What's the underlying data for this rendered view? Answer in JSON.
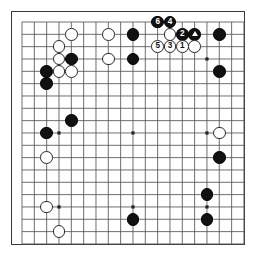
{
  "app": {
    "title": "Go Board Diagram",
    "type": "go-game-diagram"
  },
  "board": {
    "size": 19,
    "origin_x": 22,
    "origin_y": 22,
    "spacing": 12.33,
    "stone_radius": 6.3,
    "line_color": "#555555",
    "border_color": "#3a3a3a",
    "background": "#ffffff",
    "black_color": "#111111",
    "white_color": "#ffffff",
    "star_points": [
      {
        "col": 3,
        "row": 3
      },
      {
        "col": 9,
        "row": 3
      },
      {
        "col": 15,
        "row": 3
      },
      {
        "col": 3,
        "row": 9
      },
      {
        "col": 9,
        "row": 9
      },
      {
        "col": 15,
        "row": 9
      },
      {
        "col": 3,
        "row": 15
      },
      {
        "col": 9,
        "row": 15
      },
      {
        "col": 15,
        "row": 15
      }
    ]
  },
  "stones": [
    {
      "col": 4,
      "row": 1,
      "color": "white",
      "label": ""
    },
    {
      "col": 3,
      "row": 2,
      "color": "white",
      "label": ""
    },
    {
      "col": 3,
      "row": 3,
      "color": "white",
      "label": ""
    },
    {
      "col": 4,
      "row": 3,
      "color": "black",
      "label": ""
    },
    {
      "col": 2,
      "row": 4,
      "color": "black",
      "label": ""
    },
    {
      "col": 3,
      "row": 4,
      "color": "white",
      "label": ""
    },
    {
      "col": 4,
      "row": 4,
      "color": "white",
      "label": ""
    },
    {
      "col": 2,
      "row": 5,
      "color": "black",
      "label": ""
    },
    {
      "col": 7,
      "row": 1,
      "color": "white",
      "label": ""
    },
    {
      "col": 7,
      "row": 3,
      "color": "white",
      "label": ""
    },
    {
      "col": 9,
      "row": 1,
      "color": "black",
      "label": ""
    },
    {
      "col": 9,
      "row": 3,
      "color": "black",
      "label": ""
    },
    {
      "col": 11,
      "row": 0,
      "color": "black",
      "label": "6"
    },
    {
      "col": 12,
      "row": 0,
      "color": "black",
      "label": "4"
    },
    {
      "col": 12,
      "row": 1,
      "color": "white",
      "label": ""
    },
    {
      "col": 13,
      "row": 1,
      "color": "black",
      "label": "2"
    },
    {
      "col": 14,
      "row": 1,
      "color": "black",
      "label": "triangle"
    },
    {
      "col": 11,
      "row": 2,
      "color": "white",
      "label": "5"
    },
    {
      "col": 12,
      "row": 2,
      "color": "white",
      "label": "3"
    },
    {
      "col": 13,
      "row": 2,
      "color": "white",
      "label": "1"
    },
    {
      "col": 14,
      "row": 2,
      "color": "white",
      "label": ""
    },
    {
      "col": 16,
      "row": 1,
      "color": "black",
      "label": ""
    },
    {
      "col": 16,
      "row": 4,
      "color": "black",
      "label": ""
    },
    {
      "col": 16,
      "row": 9,
      "color": "white",
      "label": ""
    },
    {
      "col": 16,
      "row": 11,
      "color": "black",
      "label": ""
    },
    {
      "col": 4,
      "row": 8,
      "color": "black",
      "label": ""
    },
    {
      "col": 2,
      "row": 9,
      "color": "black",
      "label": ""
    },
    {
      "col": 2,
      "row": 11,
      "color": "white",
      "label": ""
    },
    {
      "col": 2,
      "row": 15,
      "color": "white",
      "label": ""
    },
    {
      "col": 3,
      "row": 17,
      "color": "white",
      "label": ""
    },
    {
      "col": 9,
      "row": 16,
      "color": "black",
      "label": ""
    },
    {
      "col": 15,
      "row": 14,
      "color": "black",
      "label": ""
    },
    {
      "col": 15,
      "row": 16,
      "color": "black",
      "label": ""
    }
  ],
  "move_sequence": {
    "moves": [
      "1",
      "2",
      "3",
      "4",
      "5",
      "6"
    ],
    "marked_stone": "triangle",
    "black_moves": [
      "2",
      "4",
      "6"
    ],
    "white_moves": [
      "1",
      "3",
      "5"
    ]
  }
}
